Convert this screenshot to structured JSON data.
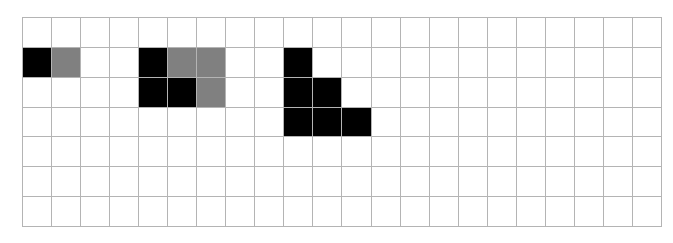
{
  "grid": {
    "columns": 22,
    "rows": 7,
    "colors": {
      "empty": "#ffffff",
      "black": "#000000",
      "gray": "#808080",
      "line": "#b4b4b4"
    },
    "filled_cells": [
      {
        "row": 1,
        "col": 0,
        "color": "black"
      },
      {
        "row": 1,
        "col": 1,
        "color": "gray"
      },
      {
        "row": 1,
        "col": 4,
        "color": "black"
      },
      {
        "row": 1,
        "col": 5,
        "color": "gray"
      },
      {
        "row": 1,
        "col": 6,
        "color": "gray"
      },
      {
        "row": 1,
        "col": 9,
        "color": "black"
      },
      {
        "row": 2,
        "col": 4,
        "color": "black"
      },
      {
        "row": 2,
        "col": 5,
        "color": "black"
      },
      {
        "row": 2,
        "col": 6,
        "color": "gray"
      },
      {
        "row": 2,
        "col": 9,
        "color": "black"
      },
      {
        "row": 2,
        "col": 10,
        "color": "black"
      },
      {
        "row": 3,
        "col": 9,
        "color": "black"
      },
      {
        "row": 3,
        "col": 10,
        "color": "black"
      },
      {
        "row": 3,
        "col": 11,
        "color": "black"
      }
    ]
  }
}
